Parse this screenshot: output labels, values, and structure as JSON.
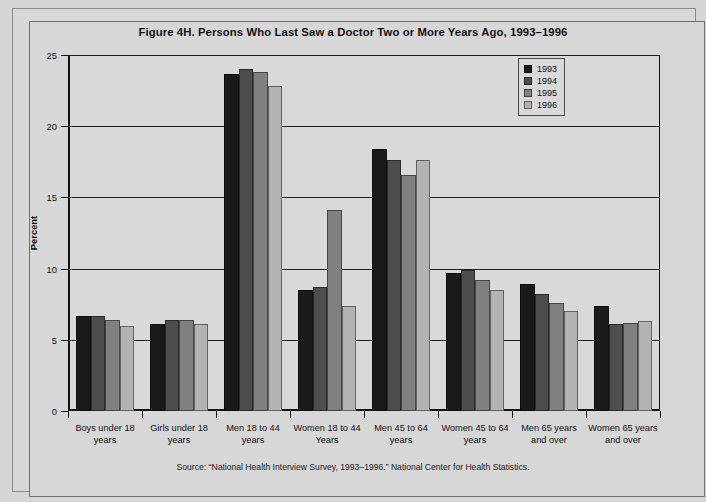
{
  "chart_data": {
    "type": "bar",
    "title": "Figure 4H. Persons Who Last Saw a Doctor Two or More Years Ago, 1993–1996",
    "xlabel": "",
    "ylabel": "Percent",
    "ylim": [
      0,
      25
    ],
    "yticks": [
      0,
      5,
      10,
      15,
      20,
      25
    ],
    "grid": true,
    "legend_position": "top-right",
    "categories": [
      "Boys under 18 years",
      "Girls under 18 years",
      "Men 18 to 44 years",
      "Women 18 to 44 Years",
      "Men 45 to 64 years",
      "Women 45 to 64 years",
      "Men 65 years and over",
      "Women 65 years and over"
    ],
    "series": [
      {
        "name": "1993",
        "color": "#1a1a1a",
        "values": [
          6.7,
          6.1,
          23.7,
          8.5,
          18.4,
          9.7,
          8.9,
          7.4
        ]
      },
      {
        "name": "1994",
        "color": "#4d4d4d",
        "values": [
          6.7,
          6.4,
          24.0,
          8.7,
          17.6,
          9.9,
          8.2,
          6.1
        ]
      },
      {
        "name": "1995",
        "color": "#808080",
        "values": [
          6.4,
          6.4,
          23.8,
          14.1,
          16.6,
          9.2,
          7.6,
          6.2
        ]
      },
      {
        "name": "1996",
        "color": "#b3b3b3",
        "values": [
          6.0,
          6.1,
          22.8,
          7.4,
          17.6,
          8.5,
          7.0,
          6.3
        ]
      }
    ],
    "source": "Source: “National Health Interview Survey, 1993–1996.” National Center for Health Statistics."
  },
  "legend": {
    "items": [
      {
        "label": "1993",
        "color": "#1a1a1a"
      },
      {
        "label": "1994",
        "color": "#4d4d4d"
      },
      {
        "label": "1995",
        "color": "#808080"
      },
      {
        "label": "1996",
        "color": "#b3b3b3"
      }
    ]
  }
}
